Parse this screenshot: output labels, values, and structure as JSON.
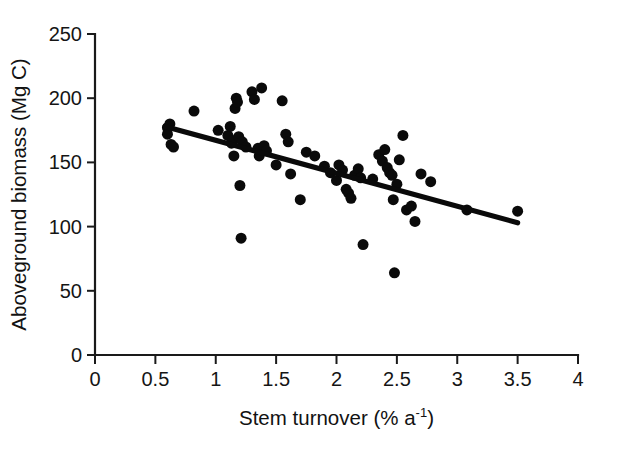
{
  "chart_data": {
    "type": "scatter",
    "title": "",
    "xlabel": "Stem turnover (% a-1)",
    "xlabel_parts": {
      "base": "Stem turnover (% a",
      "sup": "-1",
      "tail": ")"
    },
    "ylabel": "Aboveground biomass (Mg C)",
    "xlim": [
      0,
      4
    ],
    "ylim": [
      0,
      250
    ],
    "xticks": [
      0,
      0.5,
      1,
      1.5,
      2,
      2.5,
      3,
      3.5,
      4
    ],
    "xticklabels": [
      "0",
      "0.5",
      "1",
      "1.5",
      "2",
      "2.5",
      "3",
      "3.5",
      "4"
    ],
    "yticks": [
      0,
      50,
      100,
      150,
      200,
      250
    ],
    "yticklabels": [
      "0",
      "50",
      "100",
      "150",
      "200",
      "250"
    ],
    "grid": false,
    "legend": null,
    "marker_color": "#0a0a0a",
    "marker_size_px": 11,
    "line_color": "#0a0a0a",
    "trendline": {
      "x": [
        0.58,
        3.5
      ],
      "y": [
        178,
        103
      ]
    },
    "points": [
      [
        0.6,
        177
      ],
      [
        0.6,
        172
      ],
      [
        0.62,
        180
      ],
      [
        0.63,
        164
      ],
      [
        0.65,
        162
      ],
      [
        0.82,
        190
      ],
      [
        1.02,
        175
      ],
      [
        1.1,
        171
      ],
      [
        1.12,
        178
      ],
      [
        1.13,
        165
      ],
      [
        1.14,
        167
      ],
      [
        1.15,
        155
      ],
      [
        1.16,
        192
      ],
      [
        1.17,
        200
      ],
      [
        1.18,
        197
      ],
      [
        1.19,
        170
      ],
      [
        1.2,
        132
      ],
      [
        1.21,
        91
      ],
      [
        1.22,
        166
      ],
      [
        1.25,
        162
      ],
      [
        1.3,
        205
      ],
      [
        1.32,
        199
      ],
      [
        1.35,
        161
      ],
      [
        1.36,
        155
      ],
      [
        1.38,
        208
      ],
      [
        1.4,
        163
      ],
      [
        1.42,
        159
      ],
      [
        1.5,
        148
      ],
      [
        1.55,
        198
      ],
      [
        1.58,
        172
      ],
      [
        1.6,
        166
      ],
      [
        1.62,
        141
      ],
      [
        1.7,
        121
      ],
      [
        1.75,
        158
      ],
      [
        1.82,
        155
      ],
      [
        1.9,
        147
      ],
      [
        1.95,
        142
      ],
      [
        2.0,
        136
      ],
      [
        2.02,
        148
      ],
      [
        2.05,
        144
      ],
      [
        2.08,
        129
      ],
      [
        2.1,
        126
      ],
      [
        2.12,
        122
      ],
      [
        2.15,
        140
      ],
      [
        2.18,
        145
      ],
      [
        2.2,
        138
      ],
      [
        2.22,
        86
      ],
      [
        2.3,
        137
      ],
      [
        2.35,
        156
      ],
      [
        2.38,
        151
      ],
      [
        2.4,
        160
      ],
      [
        2.42,
        146
      ],
      [
        2.44,
        142
      ],
      [
        2.46,
        140
      ],
      [
        2.47,
        121
      ],
      [
        2.48,
        64
      ],
      [
        2.5,
        133
      ],
      [
        2.52,
        152
      ],
      [
        2.55,
        171
      ],
      [
        2.58,
        113
      ],
      [
        2.62,
        116
      ],
      [
        2.65,
        104
      ],
      [
        2.7,
        141
      ],
      [
        2.78,
        135
      ],
      [
        3.08,
        113
      ],
      [
        3.5,
        112
      ]
    ]
  }
}
